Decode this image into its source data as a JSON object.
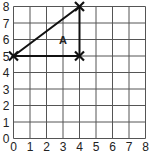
{
  "chart_data": {
    "type": "scatter",
    "title": "",
    "xlabel": "",
    "ylabel": "",
    "xlim": [
      0,
      8
    ],
    "ylim": [
      0,
      8
    ],
    "grid": true,
    "x_ticks": [
      "0",
      "1",
      "2",
      "3",
      "4",
      "5",
      "6",
      "7",
      "8"
    ],
    "y_ticks": [
      "0",
      "1",
      "2",
      "3",
      "4",
      "5",
      "6",
      "7",
      "8"
    ],
    "shapes": [
      {
        "name": "A",
        "kind": "triangle",
        "vertices": [
          [
            0,
            5
          ],
          [
            4,
            8
          ],
          [
            4,
            5
          ]
        ],
        "label_position": [
          3,
          6
        ]
      }
    ],
    "markers": [
      {
        "x": 0,
        "y": 5,
        "symbol": "x"
      },
      {
        "x": 4,
        "y": 8,
        "symbol": "x"
      },
      {
        "x": 4,
        "y": 5,
        "symbol": "x"
      }
    ]
  },
  "shape_label": "A",
  "colors": {
    "grid": "#555555",
    "line": "#111111",
    "background": "#ffffff"
  }
}
